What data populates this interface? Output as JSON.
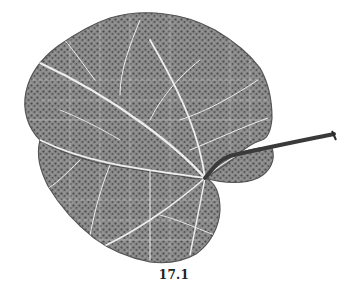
{
  "figure": {
    "caption": "17.1",
    "colors": {
      "background": "#ffffff",
      "leaf_fill": "#7a7a7a",
      "leaf_dark": "#4a4a4a",
      "vein": "#f2f2f2",
      "petiole": "#3a3a3a",
      "caption": "#222222"
    }
  }
}
